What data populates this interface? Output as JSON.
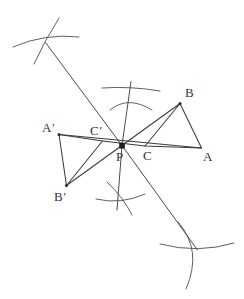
{
  "figure": {
    "width": 244,
    "height": 299,
    "background_color": "#ffffff",
    "ink_color": "#3a3a42",
    "arc_color": "#55555d",
    "marker_color": "#1d1d22"
  },
  "labels": {
    "A": {
      "text": "A",
      "prime": "",
      "x": 203,
      "y": 150
    },
    "B": {
      "text": "B",
      "prime": "",
      "x": 185,
      "y": 86
    },
    "C": {
      "text": "C",
      "prime": "",
      "x": 143,
      "y": 149
    },
    "P": {
      "text": "P",
      "prime": "",
      "x": 116,
      "y": 150
    },
    "A_prime": {
      "text": "A",
      "prime": "′",
      "x": 42,
      "y": 121
    },
    "B_prime": {
      "text": "B",
      "prime": "′",
      "x": 54,
      "y": 190
    },
    "C_prime": {
      "text": "C",
      "prime": "′",
      "x": 90,
      "y": 124
    }
  },
  "points": {
    "P": {
      "x": 122.0,
      "y": 145.5,
      "label": "P",
      "marker": "filled-square",
      "size": 4.0
    },
    "A": {
      "x": 201.5,
      "y": 148.0,
      "label": "A",
      "marker": "none"
    },
    "B": {
      "x": 180.0,
      "y": 103.5,
      "label": "B",
      "marker": "dot",
      "size": 1.6
    },
    "C": {
      "x": 145.0,
      "y": 146.0,
      "label": "C",
      "marker": "none"
    },
    "Ap": {
      "x": 59.0,
      "y": 134.5,
      "label": "A'",
      "marker": "dot",
      "size": 1.5
    },
    "Bp": {
      "x": 66.5,
      "y": 185.5,
      "label": "B'",
      "marker": "dot",
      "size": 1.6
    },
    "Cp": {
      "x": 102.5,
      "y": 141.0,
      "label": "C'",
      "marker": "none"
    }
  },
  "triangles": [
    {
      "name": "triangle-ABC",
      "vertices": [
        "A",
        "B",
        "C"
      ],
      "path": "M 201.5 148 L 180 103.5 L 145 146 Z"
    },
    {
      "name": "triangle-A-prime-B-prime-C-prime",
      "vertices": [
        "A'",
        "B'",
        "C'"
      ],
      "path": "M 59 134.5 L 66.5 185.5 L 102.5 141 Z"
    }
  ],
  "construction_lines": [
    {
      "name": "line-A-prime-through-P-to-A",
      "path": "M 59 134.5 L 201.5 148"
    },
    {
      "name": "line-B-prime-through-P-to-B",
      "path": "M 66.5 185.5 L 180 103.5"
    },
    {
      "name": "line-C-prime-through-P-to-C",
      "path": "M 102.5 141 L 145 146"
    },
    {
      "name": "ray-P-to-upper-left-arc-intersection",
      "path": "M 122 145.5 L 45.5 42.5"
    },
    {
      "name": "ray-P-to-lower-right-arc-intersection",
      "path": "M 122 145.5 L 197.5 250.0"
    },
    {
      "name": "ray-P-to-upper-arc-intersection",
      "path": "M 122 145.5 L 131.0 81.5"
    },
    {
      "name": "ray-P-to-lower-arc-intersection",
      "path": "M 122 145.5 L 117.0 210.0"
    }
  ],
  "arc_clusters": [
    {
      "name": "arc-cluster-upper-left",
      "intersection": {
        "x": 45.5,
        "y": 42.5
      },
      "arcs": [
        "M 13 47 Q 45 33 79 37",
        "M 59 18 Q 44 42 34 64"
      ]
    },
    {
      "name": "arc-cluster-upper-centre",
      "intersection": {
        "x": 130,
        "y": 95
      },
      "arcs": [
        "M 102 88 Q 131 86 160 91",
        "M 110 110 Q 128 95 152 110"
      ]
    },
    {
      "name": "arc-cluster-lower-centre",
      "intersection": {
        "x": 120,
        "y": 196
      },
      "arcs": [
        "M 96 199 Q 121 205 145 194",
        "M 107 182 Q 123 197 132 215"
      ]
    },
    {
      "name": "arc-cluster-lower-right",
      "intersection": {
        "x": 197.5,
        "y": 250
      },
      "arcs": [
        "M 160 244 Q 198 254 234 243",
        "M 178 222 Q 203 250 186 289"
      ]
    }
  ]
}
